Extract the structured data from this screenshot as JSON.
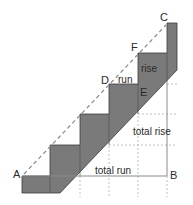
{
  "diagram": {
    "points": {
      "A": "A",
      "B": "B",
      "C": "C",
      "D": "D",
      "E": "E",
      "F": "F"
    },
    "labels": {
      "run": "run",
      "rise": "rise",
      "total_rise": "total rise",
      "total_run": "total run"
    },
    "colors": {
      "stair_fill": "#7a7a7a",
      "stair_stroke": "#3a3a3a",
      "guide_line": "#8a8a8a",
      "dashed_line": "#8a8a8a",
      "background": "#ffffff"
    }
  }
}
